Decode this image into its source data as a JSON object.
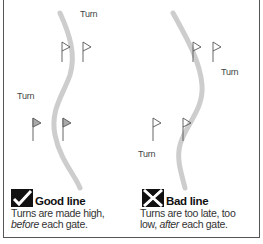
{
  "diagram": {
    "type": "ski-gate-line-comparison",
    "colors": {
      "line": "#cccccc",
      "flag": "#555555",
      "border": "#555555",
      "icon": "#111111"
    },
    "panels": [
      {
        "id": "good",
        "icon": "check-icon",
        "title": "Good line",
        "caption_line1": "Turns are made high,",
        "caption_line2_em": "before",
        "caption_line2_rest": " each gate.",
        "turn_labels": [
          "Turn",
          "Turn"
        ]
      },
      {
        "id": "bad",
        "icon": "cross-icon",
        "title": "Bad line",
        "caption_line1": "Turns are too late, too",
        "caption_line2_prefix": "low, ",
        "caption_line2_em": "after",
        "caption_line2_rest": " each gate.",
        "turn_labels": [
          "Turn",
          "Turn"
        ]
      }
    ]
  }
}
